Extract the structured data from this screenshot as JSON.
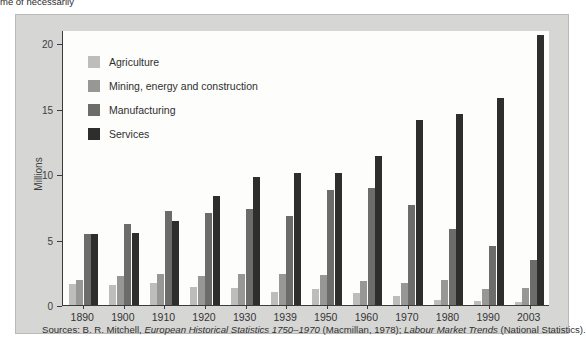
{
  "page": {
    "top_cut_text": "me of necessarily"
  },
  "chart_data": {
    "type": "bar",
    "title": "",
    "xlabel": "",
    "ylabel": "Millions",
    "ylim": [
      0,
      21
    ],
    "yticks": [
      0,
      5,
      10,
      15,
      20
    ],
    "ytick_labels": [
      "0",
      "5",
      "10",
      "15",
      "20"
    ],
    "grid": false,
    "legend_position": "upper-left-inside",
    "categories": [
      "1890",
      "1900",
      "1910",
      "1920",
      "1930",
      "1939",
      "1950",
      "1960",
      "1970",
      "1980",
      "1990",
      "2003"
    ],
    "series": [
      {
        "name": "Agriculture",
        "color": "#bdbdbb",
        "values": [
          1.6,
          1.5,
          1.7,
          1.4,
          1.3,
          1.0,
          1.2,
          0.9,
          0.7,
          0.4,
          0.3,
          0.25
        ]
      },
      {
        "name": "Mining, energy and construction",
        "color": "#979795",
        "values": [
          1.9,
          2.2,
          2.4,
          2.2,
          2.4,
          2.4,
          2.3,
          1.8,
          1.7,
          1.9,
          1.2,
          1.3
        ]
      },
      {
        "name": "Manufacturing",
        "color": "#6c6c6a",
        "values": [
          5.4,
          6.2,
          7.2,
          7.0,
          7.3,
          6.8,
          8.8,
          8.9,
          7.6,
          5.8,
          4.5,
          3.4
        ]
      },
      {
        "name": "Services",
        "color": "#2e2e2c",
        "values": [
          5.4,
          5.5,
          6.4,
          8.3,
          9.8,
          10.1,
          10.1,
          11.4,
          14.1,
          14.6,
          15.8,
          20.6
        ]
      }
    ]
  },
  "legend": {
    "items": [
      {
        "label": "Agriculture",
        "color": "#bdbdbb"
      },
      {
        "label": "Mining, energy and construction",
        "color": "#979795"
      },
      {
        "label": "Manufacturing",
        "color": "#6c6c6a"
      },
      {
        "label": "Services",
        "color": "#2e2e2c"
      }
    ]
  },
  "source": {
    "prefix": "Sources: B. R. Mitchell, ",
    "italic_one": "European Historical Statistics 1750–1970",
    "middle": " (Macmillan, 1978); ",
    "italic_two": "Labour Market Trends",
    "suffix": " (National Statistics)."
  }
}
